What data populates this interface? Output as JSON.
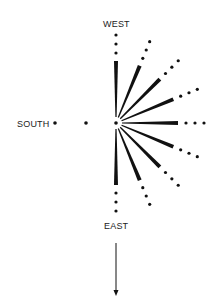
{
  "labels": {
    "west": "WEST",
    "south": "SOUTH",
    "east": "EAST"
  },
  "geometry": {
    "center": [
      116,
      123
    ],
    "ray_start": 6,
    "ray_end": 62,
    "dot_radii": [
      70,
      79,
      88
    ],
    "angles_deg": [
      0,
      22.5,
      45,
      67.5,
      90,
      112.5,
      135,
      157.5,
      180
    ],
    "south_dots_x": [
      86,
      55
    ],
    "arrow": {
      "x": 116,
      "y1": 243,
      "y2": 296
    }
  },
  "colors": {
    "ink": "#111111",
    "background": "#ffffff"
  }
}
